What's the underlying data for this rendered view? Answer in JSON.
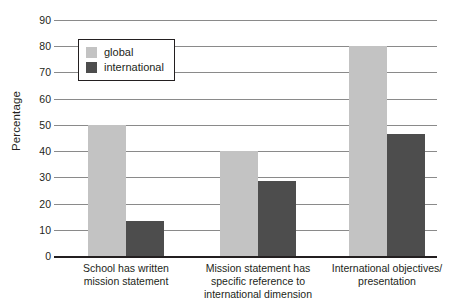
{
  "chart_data": {
    "type": "bar",
    "title": "",
    "xlabel": "",
    "ylabel": "Percentage",
    "ylim": [
      0,
      90
    ],
    "ytick_step": 10,
    "yticks": [
      "90",
      "80",
      "70",
      "60",
      "50",
      "40",
      "30",
      "20",
      "10",
      "0"
    ],
    "grid": true,
    "legend_position": "top-left",
    "categories": [
      "School has written mission statement",
      "Mission statement has specific reference to international dimension",
      "International objectives/ presentation"
    ],
    "category_lines": [
      [
        "School has written",
        "mission statement"
      ],
      [
        "Mission statement has",
        "specific reference to",
        "international dimension"
      ],
      [
        "International objectives/",
        "presentation"
      ]
    ],
    "series": [
      {
        "name": "global",
        "color": "#c3c3c3",
        "values": [
          50,
          40,
          80
        ]
      },
      {
        "name": "international",
        "color": "#4d4d4d",
        "values": [
          13.5,
          28.5,
          46.5
        ]
      }
    ]
  },
  "legend": {
    "items": [
      {
        "label": "global",
        "color": "#c3c3c3"
      },
      {
        "label": "international",
        "color": "#4d4d4d"
      }
    ]
  },
  "colors": {
    "global": "#c3c3c3",
    "international": "#4d4d4d",
    "gridline": "#8a8a8a",
    "axis": "#231f20",
    "text": "#231f20",
    "background": "#ffffff"
  }
}
